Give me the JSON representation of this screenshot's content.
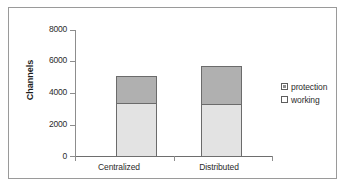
{
  "chart_data": {
    "type": "bar",
    "subtype": "stacked-bar",
    "title": "",
    "xlabel": "",
    "ylabel": "Channels",
    "categories": [
      "Centralized",
      "Distributed"
    ],
    "series": [
      {
        "name": "working",
        "values": [
          3450,
          3350
        ],
        "color": "#e3e3e3"
      },
      {
        "name": "protection",
        "values": [
          1700,
          2450
        ],
        "color": "#b0b0b0"
      }
    ],
    "totals": [
      5150,
      5800
    ],
    "ylim": [
      0,
      8000
    ],
    "yticks": [
      0,
      2000,
      4000,
      6000,
      8000
    ],
    "ytick_labels": [
      "0",
      "2000",
      "4000",
      "6000",
      "8000"
    ],
    "grid": false,
    "legend_position": "right",
    "legend_entries": [
      {
        "label": "protection",
        "swatch": "filled-gray-square"
      },
      {
        "label": "working",
        "swatch": "empty-white-square"
      }
    ]
  },
  "axis": {
    "y_title": "Channels"
  },
  "bars": [
    {
      "category": "Centralized",
      "working_value": 3450,
      "protection_value": 1700,
      "left_px": 107,
      "width_px": 41,
      "working_top_px": 94,
      "working_height_px": 55,
      "protection_top_px": 67,
      "protection_height_px": 27
    },
    {
      "category": "Distributed",
      "working_value": 3350,
      "protection_value": 2450,
      "left_px": 192,
      "width_px": 41,
      "working_top_px": 96,
      "working_height_px": 53,
      "protection_top_px": 57,
      "protection_height_px": 39
    }
  ],
  "ytick_positions_px": [
    148,
    117,
    85,
    53,
    22
  ],
  "xtick_positions_px": [
    66,
    165,
    264
  ],
  "xlabel_positions_px": [
    88,
    173
  ]
}
